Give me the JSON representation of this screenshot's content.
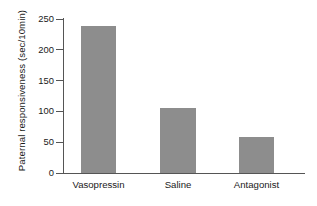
{
  "chart_data": {
    "type": "bar",
    "title": "",
    "subtitle": "",
    "xlabel": "",
    "ylabel": "Paternal responsiveness (sec/10min)",
    "categories": [
      "Vasopressin",
      "Saline",
      "Antagonist"
    ],
    "values": [
      238,
      106,
      59
    ],
    "ylim": [
      0,
      262
    ],
    "yticks": [
      0,
      50,
      100,
      150,
      200,
      250
    ],
    "ytick_labels": [
      "0",
      "50",
      "100",
      "150",
      "200",
      "250"
    ],
    "grid": false,
    "legend": null,
    "legend_position": "none",
    "bar_color": "#8d8d8d",
    "axis_color": "#555555",
    "background_color": "#ffffff",
    "annotations": []
  },
  "figure": {
    "axis_title_y": "Paternal responsiveness (sec/10min)"
  }
}
